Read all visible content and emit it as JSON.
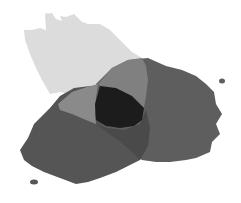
{
  "diagram": {
    "type": "venn-ink-blobs",
    "blobs": [
      {
        "name": "top-blob",
        "color": "#dcdcdc"
      },
      {
        "name": "right-blob",
        "color": "#5e5e5e"
      },
      {
        "name": "left-blob",
        "color": "#555555"
      }
    ],
    "overlap_colors": {
      "top_left": "#8a8a8a",
      "top_right": "#808080",
      "left_right": "#4a4a4a",
      "center": "#1c1c1c"
    }
  }
}
